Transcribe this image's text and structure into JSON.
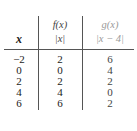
{
  "table": {
    "headers": {
      "x": "x",
      "f_name": "f(x)",
      "f_expr": "|x|",
      "g_name": "g(x)",
      "g_expr": "|x − 4|"
    },
    "rows": [
      {
        "x": "−2",
        "f": "2",
        "g": "6"
      },
      {
        "x": "0",
        "f": "0",
        "g": "4"
      },
      {
        "x": "2",
        "f": "2",
        "g": "2"
      },
      {
        "x": "4",
        "f": "4",
        "g": "0"
      },
      {
        "x": "6",
        "f": "6",
        "g": "2"
      }
    ]
  }
}
